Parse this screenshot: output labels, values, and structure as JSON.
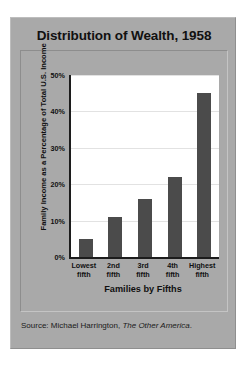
{
  "figure": {
    "title": "Distribution of Wealth, 1958",
    "source_prefix": "Source: Michael Harrington,",
    "source_book": "The Other America",
    "source_suffix": ".",
    "panel_color": "#a9a9a9",
    "plot_color": "#ffffff",
    "bar_color": "#4b4b4b"
  },
  "chart_data": {
    "type": "bar",
    "title": "Distribution of Wealth, 1958",
    "xlabel": "Families by Fifths",
    "ylabel": "Family Income as a Percentage of Total U.S. Income",
    "categories": [
      "Lowest fifth",
      "2nd fifth",
      "3rd fifth",
      "4th fifth",
      "Highest fifth"
    ],
    "category_lines": [
      [
        "Lowest",
        "fifth"
      ],
      [
        "2nd",
        "fifth"
      ],
      [
        "3rd",
        "fifth"
      ],
      [
        "4th",
        "fifth"
      ],
      [
        "Highest",
        "fifth"
      ]
    ],
    "values": [
      5,
      11,
      16,
      22,
      45
    ],
    "ylim": [
      0,
      50
    ],
    "yticks": [
      0,
      10,
      20,
      30,
      40,
      50
    ],
    "ytick_labels": [
      "0%",
      "10%",
      "20%",
      "30%",
      "40%",
      "50%"
    ],
    "grid": true,
    "legend": "none",
    "series": [
      {
        "name": "Family income share",
        "values": [
          5,
          11,
          16,
          22,
          45
        ]
      }
    ]
  }
}
